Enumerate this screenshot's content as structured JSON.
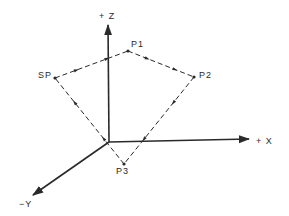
{
  "diagram": {
    "axes": [
      {
        "id": "z",
        "label": "+ Z",
        "from": [
          109,
          142
        ],
        "to": [
          108,
          25
        ],
        "label_pos": [
          99,
          19
        ]
      },
      {
        "id": "x",
        "label": "+ X",
        "from": [
          109,
          142
        ],
        "to": [
          249,
          139
        ],
        "label_pos": [
          256,
          144
        ]
      },
      {
        "id": "y",
        "label": "−Y",
        "from": [
          109,
          142
        ],
        "to": [
          33,
          195
        ],
        "label_pos": [
          19,
          207
        ]
      }
    ],
    "points": [
      {
        "id": "SP",
        "label": "SP",
        "pos": [
          55,
          78
        ],
        "label_pos": [
          38,
          78
        ]
      },
      {
        "id": "P1",
        "label": "P1",
        "pos": [
          128,
          51
        ],
        "label_pos": [
          131,
          47
        ]
      },
      {
        "id": "P2",
        "label": "P2",
        "pos": [
          194,
          77
        ],
        "label_pos": [
          199,
          78
        ]
      },
      {
        "id": "P3",
        "label": "P3",
        "pos": [
          124,
          164
        ],
        "label_pos": [
          116,
          174
        ]
      }
    ],
    "path": [
      "SP",
      "P1",
      "P2",
      "P3",
      "SP"
    ],
    "path_style": "dashed-with-direction-arrows",
    "colors": {
      "ink": "#2a2a2a",
      "background": "#ffffff"
    }
  }
}
